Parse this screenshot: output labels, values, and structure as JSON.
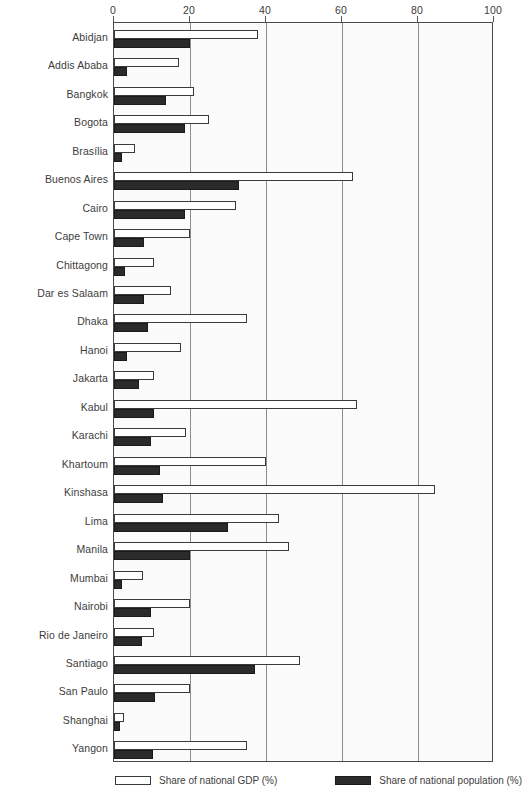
{
  "chart_data": {
    "type": "bar",
    "orientation": "horizontal",
    "title": "",
    "subtitle": "",
    "xlabel": "",
    "ylabel": "",
    "xlim": [
      0,
      100
    ],
    "grid": true,
    "grid_axis": "x",
    "legend_position": "bottom",
    "xticks": [
      0,
      20,
      40,
      60,
      80,
      100
    ],
    "xtick_labels": [
      "0",
      "20",
      "40",
      "60",
      "80",
      "100"
    ],
    "categories": [
      "Abidjan",
      "Addis Ababa",
      "Bangkok",
      "Bogota",
      "Brasília",
      "Buenos Aires",
      "Cairo",
      "Cape Town",
      "Chittagong",
      "Dar es Salaam",
      "Dhaka",
      "Hanoi",
      "Jakarta",
      "Kabul",
      "Karachi",
      "Khartoum",
      "Kinshasa",
      "Lima",
      "Manila",
      "Mumbai",
      "Nairobi",
      "Rio de Janeiro",
      "Santiago",
      "San Paulo",
      "Shanghai",
      "Yangon"
    ],
    "series": [
      {
        "name": "Share of national GDP (%)",
        "color": "#ffffff",
        "edge_color": "#3a3a3a",
        "values": [
          38,
          17,
          21,
          25,
          5.5,
          63,
          32,
          20,
          10.5,
          15,
          35,
          17.5,
          10.5,
          64,
          19,
          40,
          84.5,
          43.5,
          46,
          7.5,
          20,
          10.5,
          49,
          20,
          2.6,
          35
        ]
      },
      {
        "name": "Share of national population (%)",
        "color": "#2b2b2b",
        "edge_color": "#1a1a1a",
        "values": [
          20,
          3.5,
          13.7,
          18.7,
          2,
          33,
          18.7,
          8,
          3,
          8,
          9,
          3.4,
          6.6,
          10.5,
          9.7,
          12,
          13,
          30,
          20,
          2,
          9.7,
          7.3,
          37,
          10.8,
          1.6,
          10.3
        ]
      }
    ]
  },
  "legend": {
    "items": [
      {
        "label": "Share of national GDP (%)",
        "key": "gdp"
      },
      {
        "label": "Share of national population (%)",
        "key": "pop"
      }
    ]
  }
}
